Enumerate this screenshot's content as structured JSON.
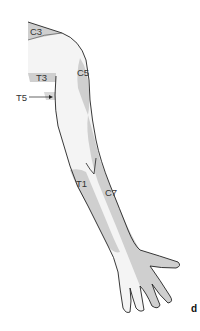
{
  "figure": {
    "panel_label": "d",
    "colors": {
      "skin": "#f4f4f4",
      "dermatome_shade": "#cfcfcf",
      "outline": "#222222",
      "label_text": "#333333"
    },
    "labels": {
      "c3": "C3",
      "c5": "C5",
      "t3": "T3",
      "t5": "T5",
      "t1": "T1",
      "c7": "C7"
    }
  }
}
